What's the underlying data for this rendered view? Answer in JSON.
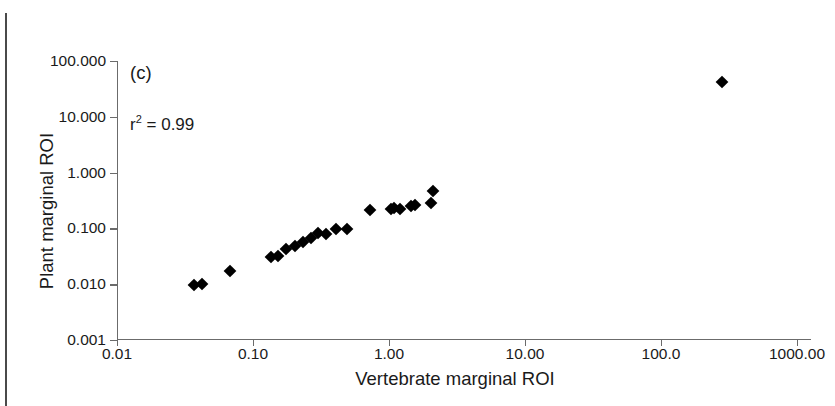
{
  "panel": {
    "label": "(c)",
    "r2_prefix": "r",
    "r2_sup": "2",
    "r2_value": " = 0.99",
    "r2_full": "r2 = 0.99"
  },
  "axes": {
    "x": {
      "title": "Vertebrate marginal ROI",
      "scale": "log",
      "min": 0.01,
      "max": 1000,
      "tick_labels": [
        "0.01",
        "0.10",
        "1.00",
        "10.00",
        "100.0",
        "1000.00"
      ],
      "tick_values": [
        0.01,
        0.1,
        1,
        10,
        100,
        1000
      ]
    },
    "y": {
      "title": "Plant marginal ROI",
      "scale": "log",
      "min": 0.001,
      "max": 100,
      "tick_labels": [
        "100.000",
        "10.000",
        "1.000",
        "0.100",
        "0.010",
        "0.001"
      ],
      "tick_values": [
        100,
        10,
        1,
        0.1,
        0.01,
        0.001
      ]
    }
  },
  "colors": {
    "marker": "#000000",
    "axis": "#6b6b6b",
    "text": "#1a1a1a",
    "background": "#ffffff",
    "page_edge": "#4a4a4a"
  },
  "chart_data": {
    "type": "scatter",
    "title": "(c)",
    "xlabel": "Vertebrate marginal ROI",
    "ylabel": "Plant marginal ROI",
    "xscale": "log",
    "yscale": "log",
    "xlim": [
      0.01,
      1000
    ],
    "ylim": [
      0.001,
      100
    ],
    "grid": false,
    "legend": false,
    "annotations": [
      "(c)",
      "r2 = 0.99"
    ],
    "marker": "diamond",
    "series": [
      {
        "name": "sites",
        "points": [
          {
            "x": 0.037,
            "y": 0.0098
          },
          {
            "x": 0.042,
            "y": 0.0102
          },
          {
            "x": 0.068,
            "y": 0.0175
          },
          {
            "x": 0.135,
            "y": 0.031
          },
          {
            "x": 0.152,
            "y": 0.032
          },
          {
            "x": 0.175,
            "y": 0.042
          },
          {
            "x": 0.205,
            "y": 0.048
          },
          {
            "x": 0.235,
            "y": 0.056
          },
          {
            "x": 0.265,
            "y": 0.068
          },
          {
            "x": 0.3,
            "y": 0.082
          },
          {
            "x": 0.345,
            "y": 0.079
          },
          {
            "x": 0.405,
            "y": 0.098
          },
          {
            "x": 0.49,
            "y": 0.099
          },
          {
            "x": 0.73,
            "y": 0.21
          },
          {
            "x": 1.03,
            "y": 0.225
          },
          {
            "x": 1.08,
            "y": 0.232
          },
          {
            "x": 1.21,
            "y": 0.225
          },
          {
            "x": 1.44,
            "y": 0.25
          },
          {
            "x": 1.56,
            "y": 0.265
          },
          {
            "x": 2.05,
            "y": 0.29
          },
          {
            "x": 2.1,
            "y": 0.465
          },
          {
            "x": 280.0,
            "y": 42.0
          }
        ]
      }
    ]
  }
}
